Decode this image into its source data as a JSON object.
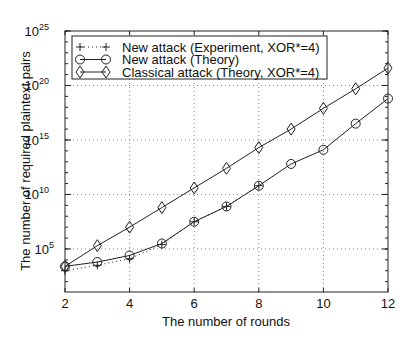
{
  "chart_data": {
    "type": "line",
    "title": "",
    "xlabel": "The number of rounds",
    "ylabel": "The number of required plaintext pairs",
    "x": [
      2,
      3,
      4,
      5,
      6,
      7,
      8,
      9,
      10,
      11,
      12
    ],
    "xlim": [
      2,
      12
    ],
    "xticks": [
      2,
      4,
      6,
      8,
      10,
      12
    ],
    "yscale": "log",
    "ylim_log10": [
      1.05,
      25
    ],
    "yticks": [
      {
        "exp": 5,
        "label": "10",
        "sup": "5"
      },
      {
        "exp": 10,
        "label": "10",
        "sup": "10"
      },
      {
        "exp": 15,
        "label": "10",
        "sup": "15"
      },
      {
        "exp": 20,
        "label": "10",
        "sup": "20"
      },
      {
        "exp": 25,
        "label": "10",
        "sup": "25"
      }
    ],
    "grid": true,
    "legend_position": "upper left",
    "series": [
      {
        "name": "New attack (Experiment, XOR*=4)",
        "marker": "plus",
        "linestyle": "dotted",
        "x": [
          2,
          3,
          4,
          5,
          6,
          7,
          8
        ],
        "log10_values": [
          3.0,
          3.5,
          4.1,
          5.4,
          7.5,
          8.9,
          10.8
        ]
      },
      {
        "name": "New attack (Theory)",
        "marker": "circle",
        "linestyle": "solid",
        "x": [
          2,
          3,
          4,
          5,
          6,
          7,
          8,
          9,
          10,
          11,
          12
        ],
        "log10_values": [
          3.4,
          3.8,
          4.4,
          5.5,
          7.5,
          8.9,
          10.8,
          12.8,
          14.1,
          16.5,
          18.8
        ]
      },
      {
        "name": "Classical attack (Theory, XOR*=4)",
        "marker": "diamond",
        "linestyle": "solid",
        "x": [
          2,
          3,
          4,
          5,
          6,
          7,
          8,
          9,
          10,
          11,
          12
        ],
        "log10_values": [
          3.4,
          5.3,
          7.0,
          8.8,
          10.6,
          12.4,
          14.3,
          16.0,
          17.9,
          19.7,
          21.6
        ]
      }
    ]
  },
  "colors": {
    "line": "#222222",
    "grid": "#888888",
    "background": "#ffffff"
  }
}
